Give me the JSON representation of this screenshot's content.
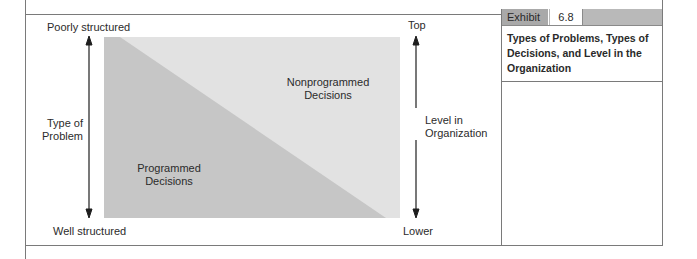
{
  "exhibit": {
    "tag_label": "Exhibit",
    "number": "6.8",
    "caption": "Types of Problems, Types of Decisions, and Level in the Organization"
  },
  "diagram": {
    "left_axis": {
      "top_label": "Poorly structured",
      "bottom_label": "Well structured",
      "axis_title_line1": "Type of",
      "axis_title_line2": "Problem"
    },
    "right_axis": {
      "top_label": "Top",
      "bottom_label": "Lower",
      "axis_title_line1": "Level in",
      "axis_title_line2": "Organization"
    },
    "regions": [
      {
        "id": "nonprogrammed",
        "line1": "Nonprogrammed",
        "line2": "Decisions",
        "color": "#e2e2e2"
      },
      {
        "id": "programmed",
        "line1": "Programmed",
        "line2": "Decisions",
        "color": "#c6c6c6"
      }
    ]
  },
  "colors": {
    "frame_line": "#7a7a7a",
    "arrow": "#1e1e1e",
    "exhibit_bar": "#b9b9b9",
    "exhibit_tag": "#a9a9a9"
  }
}
